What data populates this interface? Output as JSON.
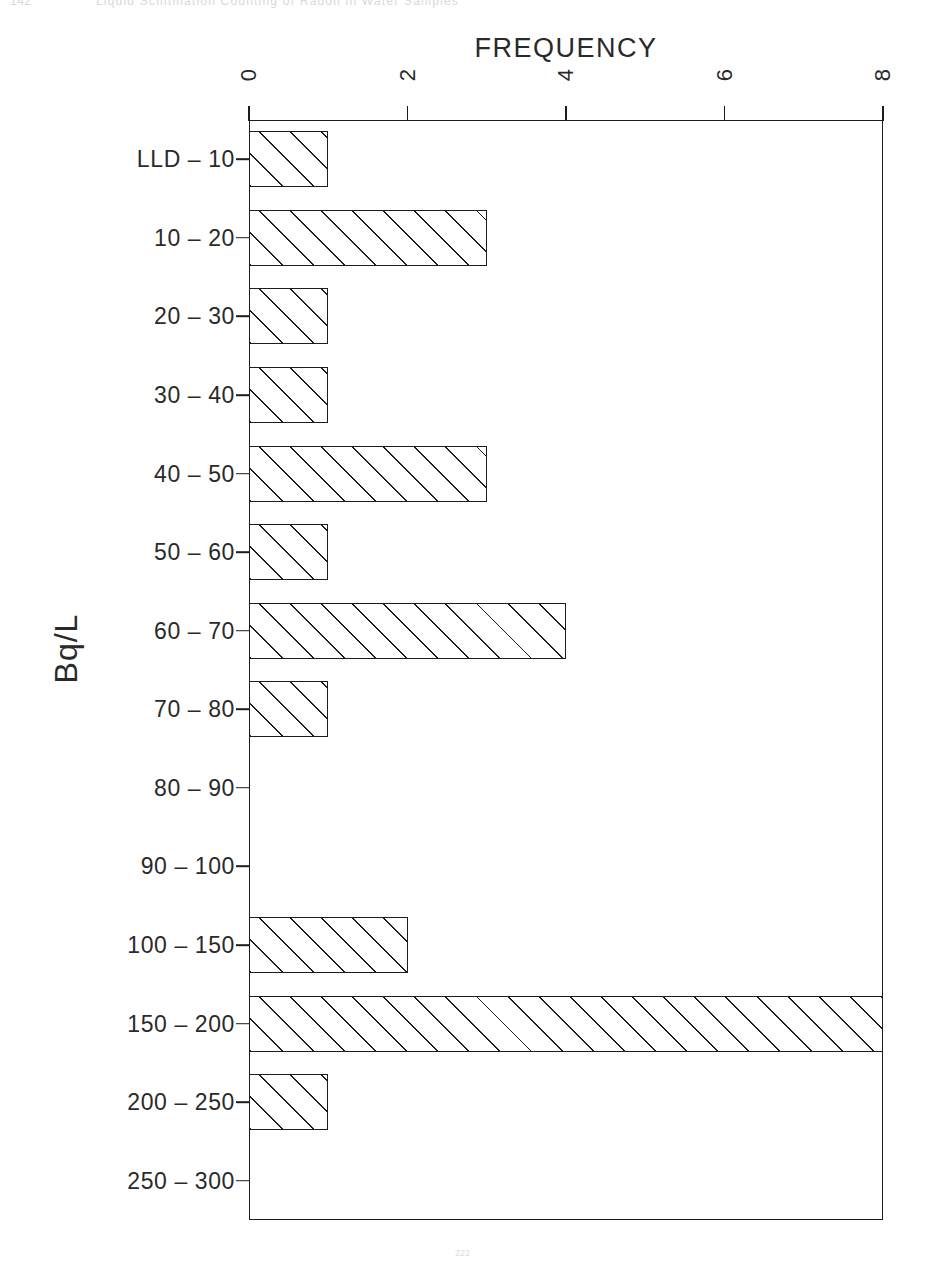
{
  "page": {
    "folio": "142",
    "running_header": "Liquid Scintillation Counting of Radon in Water Samples",
    "footer_marker": "222"
  },
  "chart_data": {
    "type": "bar",
    "orientation": "horizontal",
    "title": "",
    "xlabel": "FREQUENCY",
    "ylabel": "Bq/L",
    "xlim": [
      0,
      8
    ],
    "xticks": [
      0,
      2,
      4,
      6,
      8
    ],
    "xtick_labels": [
      "0",
      "2",
      "4",
      "6",
      "8"
    ],
    "grid": false,
    "legend": false,
    "axis_title_position": "top",
    "bar_style": "hatched-diagonal",
    "categories": [
      "LLD  –  10",
      "10  –  20",
      "20  –  30",
      "30  –  40",
      "40  –  50",
      "50  –  60",
      "60  –  70",
      "70  –  80",
      "80  –  90",
      "90  –  100",
      "100  –  150",
      "150  –  200",
      "200  –  250",
      "250  –  300"
    ],
    "values": [
      1,
      3,
      1,
      1,
      3,
      1,
      4,
      1,
      0,
      0,
      2,
      8,
      1,
      0
    ]
  }
}
